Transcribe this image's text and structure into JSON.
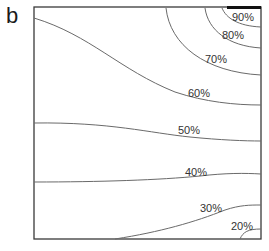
{
  "panel": {
    "label": "b"
  },
  "chart_data": {
    "type": "contour",
    "title": "",
    "xlabel": "",
    "ylabel": "",
    "grid": false,
    "legend": null,
    "frame": {
      "left": 34,
      "top": 7,
      "right": 261,
      "bottom": 239
    },
    "source_bar": {
      "x_start": 227,
      "x_end": 261,
      "y": 7,
      "thickness": 3,
      "color": "#111111"
    },
    "contours": [
      {
        "level": "90%",
        "label": "90%",
        "path": "M222,8 C226,18 238,26 261,27",
        "label_x": 232,
        "label_y": 21
      },
      {
        "level": "80%",
        "label": "80%",
        "path": "M205,8 C208,30 228,46 261,48",
        "label_x": 222,
        "label_y": 39
      },
      {
        "level": "70%",
        "label": "70%",
        "path": "M166,8 C170,45 205,72 261,75",
        "label_x": 205,
        "label_y": 63
      },
      {
        "level": "60%",
        "label": "60%",
        "path": "M34,18 C90,35 120,70 175,92 C205,102 235,105 261,105",
        "label_x": 188,
        "label_y": 97
      },
      {
        "level": "50%",
        "label": "50%",
        "path": "M34,123 C110,122 150,133 190,137 C220,140 245,141 261,141",
        "label_x": 178,
        "label_y": 134
      },
      {
        "level": "40%",
        "label": "40%",
        "path": "M34,182 C100,182 160,180 200,176 C225,173 245,173 261,174",
        "label_x": 185,
        "label_y": 176
      },
      {
        "level": "30%",
        "label": "30%",
        "path": "M115,239 C160,232 195,222 225,210 C240,205 250,205 261,205",
        "label_x": 200,
        "label_y": 212
      },
      {
        "level": "20%",
        "label": "20%",
        "path": "M240,239 C243,232 248,229 261,229",
        "label_x": 231,
        "label_y": 230
      }
    ],
    "labels": [
      "90%",
      "80%",
      "70%",
      "60%",
      "50%",
      "40%",
      "30%",
      "20%"
    ],
    "colors": {
      "frame": "#3a3a3a",
      "contour": "#6a6a6a",
      "text": "#333333",
      "background": "#ffffff"
    }
  }
}
